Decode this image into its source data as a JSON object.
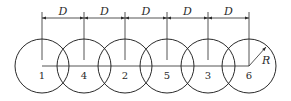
{
  "diagram": {
    "circles": [
      {
        "label": "1",
        "cx": 42
      },
      {
        "label": "4",
        "cx": 84
      },
      {
        "label": "2",
        "cx": 125
      },
      {
        "label": "5",
        "cx": 167
      },
      {
        "label": "3",
        "cx": 208
      },
      {
        "label": "6",
        "cx": 249
      }
    ],
    "spacing_labels": [
      "D",
      "D",
      "D",
      "D",
      "D"
    ],
    "radius_label": "R",
    "colors": {
      "line": "#2a2a2a",
      "background": "#ffffff"
    }
  }
}
